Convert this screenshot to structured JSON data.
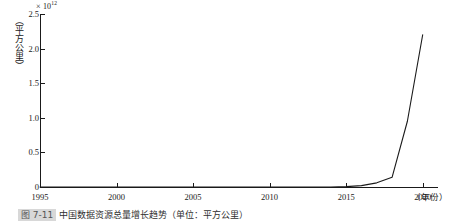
{
  "figure": {
    "background_color": "#ffffff",
    "line_color": "#1a1a1a",
    "axis_color": "#1a1a1a"
  },
  "y_axis": {
    "title": "（平方公里）",
    "multiplier_prefix": "× 10",
    "multiplier_exponent": "12",
    "tick_labels": [
      "2.5",
      "2.0",
      "1.5",
      "1.0",
      "0.5",
      "0"
    ],
    "tick_values": [
      2.5,
      2.0,
      1.5,
      1.0,
      0.5,
      0
    ]
  },
  "x_axis": {
    "title": "（年份）",
    "tick_labels": [
      "1995",
      "2000",
      "2005",
      "2010",
      "2015",
      "2020"
    ],
    "tick_values": [
      1995,
      2000,
      2005,
      2010,
      2015,
      2020
    ]
  },
  "caption": {
    "figure_number": "图 7-11",
    "text": "中国数据资源总量增长趋势（单位：平方公里）"
  },
  "chart_data": {
    "type": "line",
    "title": "",
    "xlabel": "（年份）",
    "ylabel": "（平方公里）",
    "y_multiplier": 1000000000000.0,
    "xlim": [
      1995,
      2021
    ],
    "ylim": [
      0,
      2.5
    ],
    "grid": false,
    "legend": "none",
    "x": [
      1995,
      1996,
      1997,
      1998,
      1999,
      2000,
      2001,
      2002,
      2003,
      2004,
      2005,
      2006,
      2007,
      2008,
      2009,
      2010,
      2011,
      2012,
      2013,
      2014,
      2015,
      2016,
      2017,
      2018,
      2019,
      2020
    ],
    "values": [
      0.0,
      0.0,
      0.0,
      0.0,
      0.0,
      0.0,
      0.0,
      0.0,
      0.0,
      0.0,
      0.0,
      0.0,
      0.0,
      0.0,
      0.0,
      0.0,
      0.0,
      0.0,
      0.0,
      0.0,
      0.005,
      0.02,
      0.06,
      0.14,
      0.95,
      2.2
    ]
  }
}
